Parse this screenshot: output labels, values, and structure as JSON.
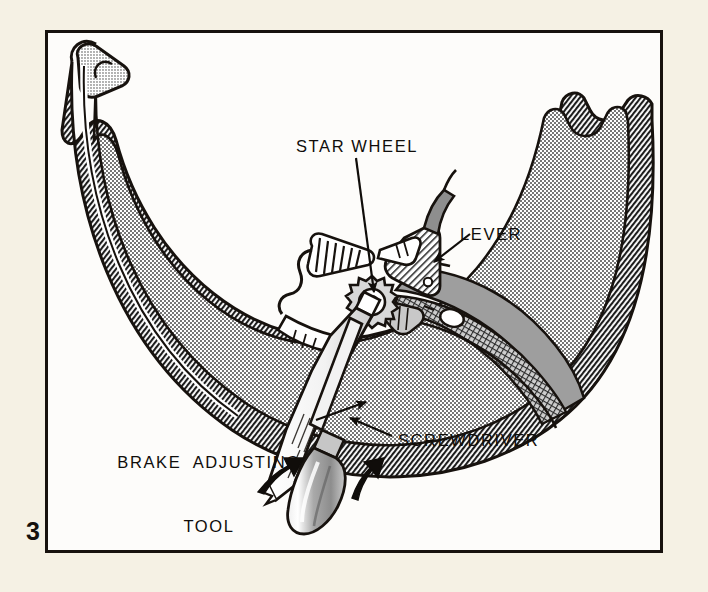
{
  "figure": {
    "number": "3",
    "kind": "technical-illustration"
  },
  "labels": {
    "star_wheel": "STAR WHEEL",
    "lever": "LEVER",
    "screwdriver": "SCREWDRIVER",
    "brake_tool_line1": "BRAKE  ADJUSTING",
    "brake_tool_line2": "TOOL"
  },
  "colors": {
    "paper": "#f5f1e4",
    "plate": "#fdfcfa",
    "ink": "#17120e",
    "stipple": "#4a4a4a",
    "shoe_gray": "#9a9a9a",
    "metal_gray": "#b4b4b4",
    "hatch": "#2b2b2b"
  },
  "callouts": [
    {
      "name": "star-wheel",
      "from": [
        356,
        158
      ],
      "to": [
        374,
        292
      ],
      "arrow": "end"
    },
    {
      "name": "lever",
      "from": [
        470,
        236
      ],
      "to": [
        433,
        262
      ],
      "arrow": "end"
    },
    {
      "name": "screwdriver",
      "from": [
        392,
        437
      ],
      "to": [
        352,
        419
      ],
      "arrow": "end"
    },
    {
      "name": "brake-adjusting-tool",
      "from": [
        318,
        420
      ],
      "to": [
        366,
        404
      ],
      "arrow": "end"
    }
  ],
  "motion_arrows": [
    {
      "name": "left-push-arrow",
      "direction": "up-right"
    },
    {
      "name": "right-push-arrow",
      "direction": "up-right"
    }
  ]
}
